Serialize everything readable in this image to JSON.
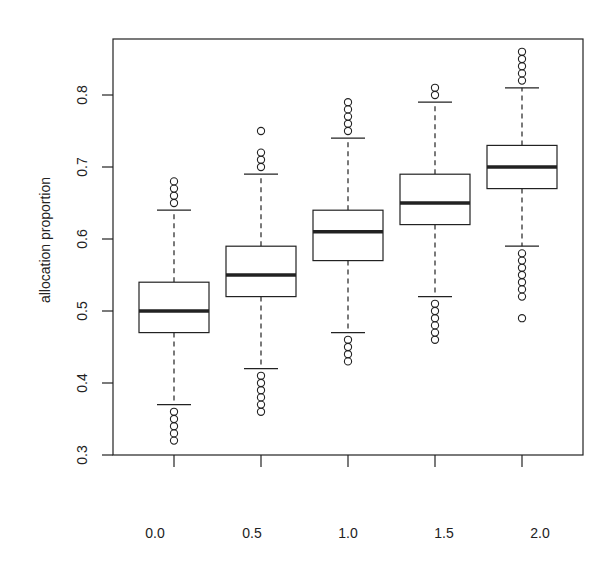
{
  "chart_data": {
    "type": "boxplot",
    "title": "",
    "xlabel": "",
    "ylabel": "allocation proportion",
    "ylim": [
      0.3,
      0.86
    ],
    "yticks": [
      "0.3",
      "0.4",
      "0.5",
      "0.6",
      "0.7",
      "0.8"
    ],
    "grid": false,
    "legend": null,
    "categories": [
      "0.0",
      "0.5",
      "1.0",
      "1.5",
      "2.0"
    ],
    "boxes": [
      {
        "label": "0.0",
        "lower_whisker": 0.37,
        "q1": 0.47,
        "median": 0.5,
        "q3": 0.54,
        "upper_whisker": 0.64,
        "outliers": [
          0.65,
          0.66,
          0.67,
          0.68,
          0.36,
          0.35,
          0.34,
          0.33,
          0.32
        ]
      },
      {
        "label": "0.5",
        "lower_whisker": 0.42,
        "q1": 0.52,
        "median": 0.55,
        "q3": 0.59,
        "upper_whisker": 0.69,
        "outliers": [
          0.7,
          0.71,
          0.72,
          0.75,
          0.41,
          0.4,
          0.39,
          0.38,
          0.37,
          0.36
        ]
      },
      {
        "label": "1.0",
        "lower_whisker": 0.47,
        "q1": 0.57,
        "median": 0.61,
        "q3": 0.64,
        "upper_whisker": 0.74,
        "outliers": [
          0.75,
          0.76,
          0.77,
          0.78,
          0.79,
          0.46,
          0.45,
          0.44,
          0.43
        ]
      },
      {
        "label": "1.5",
        "lower_whisker": 0.52,
        "q1": 0.62,
        "median": 0.65,
        "q3": 0.69,
        "upper_whisker": 0.79,
        "outliers": [
          0.8,
          0.81,
          0.51,
          0.5,
          0.49,
          0.48,
          0.47,
          0.46
        ]
      },
      {
        "label": "2.0",
        "lower_whisker": 0.59,
        "q1": 0.67,
        "median": 0.7,
        "q3": 0.73,
        "upper_whisker": 0.81,
        "outliers": [
          0.82,
          0.83,
          0.84,
          0.85,
          0.86,
          0.58,
          0.57,
          0.56,
          0.55,
          0.54,
          0.53,
          0.52,
          0.49
        ]
      }
    ]
  },
  "colors": {
    "ink": "#222222",
    "background": "#ffffff"
  }
}
